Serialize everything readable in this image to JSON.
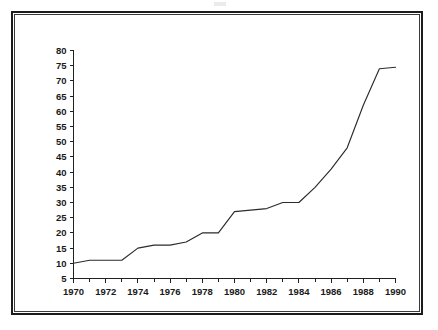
{
  "figure": {
    "title": "",
    "background_color": "#ffffff",
    "frame_color": "#1c1c1c",
    "line_color": "#2b2b2b"
  },
  "chart_data": {
    "type": "line",
    "title": "",
    "subtitle": "",
    "xlabel": "",
    "ylabel": "",
    "xlim": [
      1970,
      1990
    ],
    "ylim": [
      5,
      80
    ],
    "grid": false,
    "legend": null,
    "legend_position": "none",
    "y_ticks": [
      5,
      10,
      15,
      20,
      25,
      30,
      35,
      40,
      45,
      50,
      55,
      60,
      65,
      70,
      75,
      80
    ],
    "y_tick_labels": [
      "5",
      "10",
      "15",
      "20",
      "25",
      "30",
      "35",
      "40",
      "45",
      "50",
      "55",
      "60",
      "65",
      "70",
      "75",
      "80"
    ],
    "x_ticks": [
      1970,
      1971,
      1972,
      1973,
      1974,
      1975,
      1976,
      1977,
      1978,
      1979,
      1980,
      1981,
      1982,
      1983,
      1984,
      1985,
      1986,
      1987,
      1988,
      1989,
      1990
    ],
    "x_tick_labels_major": [
      "1970",
      "1972",
      "1974",
      "1976",
      "1978",
      "1980",
      "1982",
      "1984",
      "1986",
      "1988",
      "1990"
    ],
    "x_major_ticks": [
      1970,
      1972,
      1974,
      1976,
      1978,
      1980,
      1982,
      1984,
      1986,
      1988,
      1990
    ],
    "x": [
      1970,
      1971,
      1972,
      1973,
      1974,
      1975,
      1976,
      1977,
      1978,
      1979,
      1980,
      1981,
      1982,
      1983,
      1984,
      1985,
      1986,
      1987,
      1988,
      1989,
      1990
    ],
    "values": [
      10.0,
      11.0,
      11.0,
      11.0,
      15.0,
      16.0,
      16.0,
      17.0,
      20.0,
      20.0,
      27.0,
      27.5,
      28.0,
      30.0,
      30.0,
      35.0,
      41.0,
      48.0,
      62.0,
      74.0,
      74.5
    ],
    "series": [
      {
        "name": "series-1",
        "color": "#2b2b2b",
        "values": [
          10.0,
          11.0,
          11.0,
          11.0,
          15.0,
          16.0,
          16.0,
          17.0,
          20.0,
          20.0,
          27.0,
          27.5,
          28.0,
          30.0,
          30.0,
          35.0,
          41.0,
          48.0,
          62.0,
          74.0,
          74.5
        ]
      }
    ]
  }
}
